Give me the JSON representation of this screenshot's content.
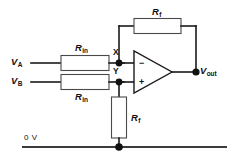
{
  "diagram": {
    "type": "circuit-schematic",
    "background_color": "#ffffff",
    "line_color": "#1a1a1a"
  },
  "sources": [
    {
      "id": "va",
      "symbol": "V",
      "subscript": "A"
    },
    {
      "id": "vb",
      "symbol": "V",
      "subscript": "B"
    }
  ],
  "output": {
    "id": "vout",
    "symbol": "V",
    "subscript": "out"
  },
  "nodes": [
    {
      "id": "x",
      "label": "X"
    },
    {
      "id": "y",
      "label": "Y"
    }
  ],
  "resistors": [
    {
      "id": "rin-a",
      "symbol": "R",
      "subscript": "in",
      "orientation": "horizontal",
      "label_position": "above"
    },
    {
      "id": "rin-b",
      "symbol": "R",
      "subscript": "in",
      "orientation": "horizontal",
      "label_position": "below"
    },
    {
      "id": "rf-feedback",
      "symbol": "R",
      "subscript": "f",
      "orientation": "horizontal",
      "label_position": "above"
    },
    {
      "id": "rf-ground",
      "symbol": "R",
      "subscript": "f",
      "orientation": "vertical",
      "label_position": "right"
    }
  ],
  "opamp": {
    "inverting_input": "−",
    "noninverting_input": "+"
  },
  "rail": {
    "id": "ground-rail",
    "label": "0 V"
  }
}
